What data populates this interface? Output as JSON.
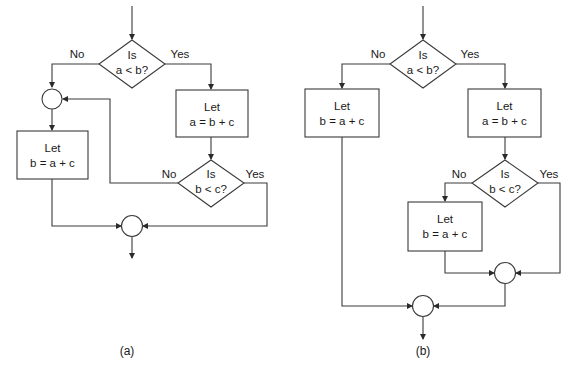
{
  "figure": {
    "panels": [
      {
        "id": "a",
        "caption": "(a)",
        "decision1": {
          "line1": "Is",
          "line2": "a < b?",
          "no_label": "No",
          "yes_label": "Yes"
        },
        "process_yes": {
          "line1": "Let",
          "line2": "a = b + c"
        },
        "process_no": {
          "line1": "Let",
          "line2": "b = a + c"
        },
        "decision2": {
          "line1": "Is",
          "line2": "b < c?",
          "no_label": "No",
          "yes_label": "Yes"
        }
      },
      {
        "id": "b",
        "caption": "(b)",
        "decision1": {
          "line1": "Is",
          "line2": "a < b?",
          "no_label": "No",
          "yes_label": "Yes"
        },
        "process_no": {
          "line1": "Let",
          "line2": "b = a + c"
        },
        "process_yes": {
          "line1": "Let",
          "line2": "a = b + c"
        },
        "decision2": {
          "line1": "Is",
          "line2": "b < c?",
          "no_label": "No",
          "yes_label": "Yes"
        },
        "process_inner": {
          "line1": "Let",
          "line2": "b = a + c"
        }
      }
    ],
    "colors": {
      "stroke": "#3a3a3a",
      "text": "#1a1a1a",
      "background": "#ffffff"
    }
  }
}
